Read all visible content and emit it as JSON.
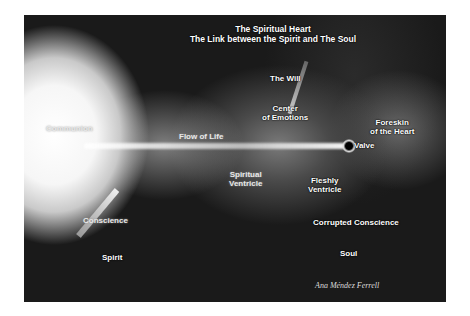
{
  "figure": {
    "title_line1": "The Spiritual Heart",
    "title_line2": "The Link between the Spirit and The Soul",
    "labels": {
      "communion": "Communion",
      "the_will": "The Will",
      "center_emotions_1": "Center",
      "center_emotions_2": "of Emotions",
      "flow_of_life": "Flow of Life",
      "foreskin_1": "Foreskin",
      "foreskin_2": "of the Heart",
      "valve": "Valve",
      "spiritual_ventricle_1": "Spiritual",
      "spiritual_ventricle_2": "Ventricle",
      "fleshly_ventricle_1": "Fleshly",
      "fleshly_ventricle_2": "Ventricle",
      "conscience": "Conscience",
      "corrupted_conscience": "Corrupted Conscience",
      "spirit": "Spirit",
      "soul": "Soul"
    },
    "signature": "Ana Méndez Ferrell",
    "colors": {
      "background": "#ffffff",
      "image_dark": "#1a1a1a",
      "label_text": "#ffffff"
    }
  }
}
